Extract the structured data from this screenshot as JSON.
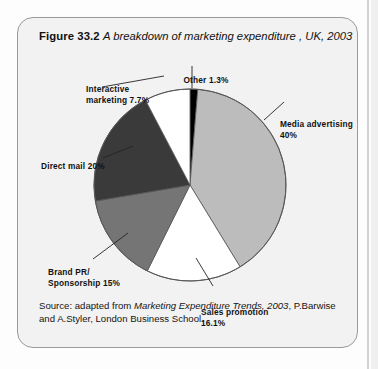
{
  "figure": {
    "number": "Figure 33.2",
    "caption": "A breakdown of marketing expenditure , UK, 2003",
    "source": "Source: adapted from ",
    "source_italic": "Marketing Expenditure Trends, 2003",
    "source_rest": ", P.Barwise and A.Styler, London Business School."
  },
  "labels": {
    "other": "Other 1.3%",
    "interactive_line1": "Interactive",
    "interactive_line2": "marketing 7.7%",
    "media_line1": "Media advertising",
    "media_line2": "40%",
    "direct": "Direct mail 20%",
    "brand_line1": "Brand PR/",
    "brand_line2": "Sponsorship 15%",
    "sales_line1": "Sales promotion",
    "sales_line2": "16.1%"
  },
  "colors": {
    "card_bg": "#f2f2f2",
    "card_border": "#9a9a9a",
    "slice_other": "#000000",
    "slice_media": "#bcbcbc",
    "slice_sales": "#ffffff",
    "slice_brand": "#757575",
    "slice_direct": "#3a3a3a",
    "slice_interactive": "#ffffff",
    "outline": "#555555",
    "text": "#111111"
  },
  "chart_data": {
    "type": "pie",
    "categories": [
      "Other",
      "Media advertising",
      "Sales promotion",
      "Brand PR/Sponsorship",
      "Direct mail",
      "Interactive marketing"
    ],
    "values": [
      1.3,
      40,
      16.1,
      15,
      20,
      7.7
    ],
    "unit": "%",
    "start_angle_deg": 0,
    "direction": "clockwise",
    "slice_colors": [
      "#000000",
      "#bcbcbc",
      "#ffffff",
      "#757575",
      "#3a3a3a",
      "#ffffff"
    ],
    "legend": "none (direct labels with leader lines)",
    "labels": [
      "Other 1.3%",
      "Media advertising 40%",
      "Sales promotion 16.1%",
      "Brand PR/ Sponsorship 15%",
      "Direct mail 20%",
      "Interactive marketing 7.7%"
    ],
    "source": "adapted from Marketing Expenditure Trends, 2003, P.Barwise and A.Styler, London Business School."
  }
}
